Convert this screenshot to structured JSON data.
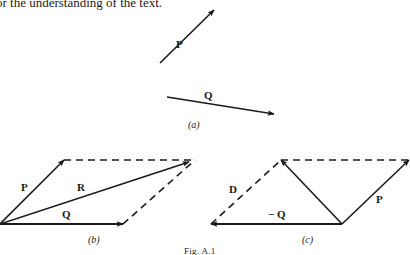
{
  "header": {
    "text": "or the understanding of the text."
  },
  "figure": {
    "caption": "Fig. A.1",
    "panels": {
      "a": {
        "label": "(a)",
        "vectors": [
          {
            "name": "P",
            "label": "P"
          },
          {
            "name": "Q",
            "label": "Q"
          }
        ]
      },
      "b": {
        "label": "(b)",
        "vectors": [
          {
            "name": "P",
            "label": "P"
          },
          {
            "name": "R",
            "label": "R"
          },
          {
            "name": "Q",
            "label": "Q"
          }
        ]
      },
      "c": {
        "label": "(c)",
        "vectors": [
          {
            "name": "D",
            "label": "D"
          },
          {
            "name": "P",
            "label": "P"
          },
          {
            "name": "-Q",
            "label": "− Q"
          }
        ]
      }
    },
    "colors": {
      "ink": "#1a1a1a",
      "background": "#ffffff"
    }
  }
}
